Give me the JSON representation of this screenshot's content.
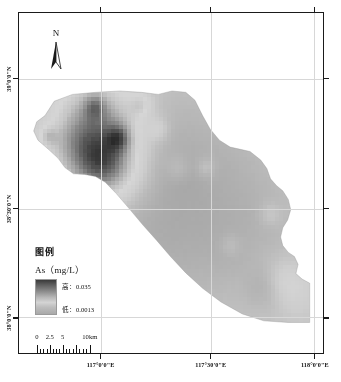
{
  "figure": {
    "type": "thematic-raster-map"
  },
  "north_arrow": {
    "label": "N",
    "icon": "north-arrow-icon"
  },
  "legend": {
    "title": "图例",
    "subtitle": "As（mg/L）",
    "high_label": "高：0.035",
    "low_label": "低：0.0013",
    "ramp_high_color": "#3a3a3a",
    "ramp_mid_color": "#d4d4d4",
    "ramp_low_color": "#a9a9a9"
  },
  "scalebar": {
    "units": "km",
    "labels": [
      "0",
      "2.5",
      "5",
      "10km"
    ],
    "label_positions_pct": [
      0,
      16,
      32,
      66
    ],
    "major_tick_positions_pct": [
      0,
      16,
      32,
      49,
      66
    ],
    "minor_tick_positions_pct": [
      4,
      8,
      12,
      20,
      24,
      28,
      36,
      40,
      45,
      53,
      57,
      61
    ],
    "bar_width_px": 80
  },
  "axes": {
    "x_labels": [
      {
        "text": "117°0'0\"E",
        "pos_pct": 27.0
      },
      {
        "text": "117°30'0\"E",
        "pos_pct": 63.0
      },
      {
        "text": "118°0'0\"E",
        "pos_pct": 97.0
      }
    ],
    "y_labels": [
      {
        "text": "39°0'0\"N",
        "pos_pct": 19.5
      },
      {
        "text": "38°30'0\"N",
        "pos_pct": 57.5
      },
      {
        "text": "38°0'0\"N",
        "pos_pct": 89.5
      }
    ],
    "grid_color": "#d7d7d7",
    "frame_color": "#1a1a1a"
  },
  "chart_data": {
    "type": "heatmap",
    "title": "As（mg/L）",
    "colorbar_label": "As (mg/L)",
    "value_min": 0.0013,
    "value_max": 0.035,
    "colormap": "grayscale-inverted",
    "grid": true,
    "legend_position": "bottom-left",
    "xlabel": "",
    "ylabel": "",
    "regions": [
      {
        "name": "northwest-lobe",
        "relative_value": "high",
        "approx_value": 0.032
      },
      {
        "name": "north-central",
        "relative_value": "high",
        "approx_value": 0.028
      },
      {
        "name": "central-plain",
        "relative_value": "low-medium",
        "approx_value": 0.006
      },
      {
        "name": "eastern-margin",
        "relative_value": "low-medium",
        "approx_value": 0.008
      },
      {
        "name": "southeast-tip",
        "relative_value": "high",
        "approx_value": 0.03
      },
      {
        "name": "southern-belt",
        "relative_value": "low",
        "approx_value": 0.003
      }
    ]
  }
}
